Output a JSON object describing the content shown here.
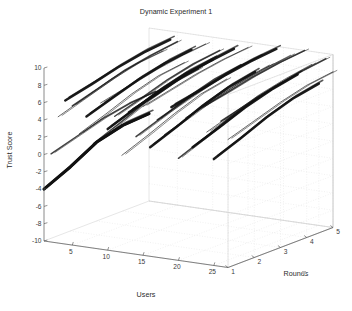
{
  "figure": {
    "title": "Dynamic Experiment 1",
    "background_color": "#ffffff",
    "line_color": "#111111",
    "grid_color": "#e2e2e2",
    "axis_color": "#4a4a4a"
  },
  "chart_data": {
    "type": "line",
    "projection": "3d",
    "title": "Dynamic Experiment 1",
    "xlabel": "Users",
    "ylabel": "Rounds",
    "zlabel": "Trust Score",
    "xlim": [
      1,
      27
    ],
    "ylim": [
      1,
      5
    ],
    "zlim": [
      -10,
      10
    ],
    "xticks": [
      5,
      10,
      15,
      20,
      25
    ],
    "yticks": [
      1,
      2,
      3,
      4,
      5
    ],
    "zticks": [
      -10,
      -8,
      -6,
      -4,
      -2,
      0,
      2,
      4,
      6,
      8,
      10
    ],
    "grid": true,
    "legend": false,
    "x": [
      1,
      2,
      3,
      4,
      5
    ],
    "series": [
      {
        "name": "User 1",
        "user": 1,
        "values": [
          -4.0,
          -2.6,
          -0.9,
          -0.1,
          0.1
        ]
      },
      {
        "name": "User 2",
        "user": 2,
        "values": [
          0.2,
          1.1,
          2.0,
          2.6,
          2.8
        ]
      },
      {
        "name": "User 3",
        "user": 3,
        "values": [
          4.6,
          5.6,
          6.6,
          7.3,
          7.6
        ]
      },
      {
        "name": "User 4",
        "user": 4,
        "values": [
          6.6,
          7.3,
          8.1,
          8.7,
          9.0
        ]
      },
      {
        "name": "User 5",
        "user": 5,
        "values": [
          6.1,
          7.0,
          7.9,
          8.5,
          8.9
        ]
      },
      {
        "name": "User 6",
        "user": 6,
        "values": [
          3.0,
          4.1,
          5.3,
          6.2,
          6.6
        ]
      },
      {
        "name": "User 7",
        "user": 7,
        "values": [
          5.1,
          6.1,
          7.1,
          7.8,
          8.2
        ]
      },
      {
        "name": "User 8",
        "user": 8,
        "values": [
          2.1,
          3.3,
          4.6,
          5.6,
          6.1
        ]
      },
      {
        "name": "User 9",
        "user": 9,
        "values": [
          6.9,
          7.6,
          8.3,
          8.8,
          9.1
        ]
      },
      {
        "name": "User 10",
        "user": 10,
        "values": [
          4.0,
          5.1,
          6.2,
          7.0,
          7.4
        ]
      },
      {
        "name": "User 11",
        "user": 11,
        "values": [
          5.6,
          6.5,
          7.5,
          8.2,
          8.6
        ]
      },
      {
        "name": "User 12",
        "user": 12,
        "values": [
          1.2,
          2.4,
          3.7,
          4.8,
          5.4
        ]
      },
      {
        "name": "User 13",
        "user": 13,
        "values": [
          6.3,
          7.1,
          8.0,
          8.6,
          9.0
        ]
      },
      {
        "name": "User 14",
        "user": 14,
        "values": [
          3.6,
          4.7,
          5.9,
          6.8,
          7.3
        ]
      },
      {
        "name": "User 15",
        "user": 15,
        "values": [
          7.2,
          7.9,
          8.6,
          9.1,
          9.4
        ]
      },
      {
        "name": "User 16",
        "user": 16,
        "values": [
          2.6,
          3.8,
          5.1,
          6.1,
          6.7
        ]
      },
      {
        "name": "User 17",
        "user": 17,
        "values": [
          5.9,
          6.8,
          7.7,
          8.4,
          8.8
        ]
      },
      {
        "name": "User 18",
        "user": 18,
        "values": [
          4.3,
          5.3,
          6.4,
          7.2,
          7.7
        ]
      },
      {
        "name": "User 19",
        "user": 19,
        "values": [
          7.6,
          8.2,
          8.9,
          9.4,
          9.7
        ]
      },
      {
        "name": "User 20",
        "user": 20,
        "values": [
          1.8,
          3.0,
          4.3,
          5.4,
          6.0
        ]
      },
      {
        "name": "User 21",
        "user": 21,
        "values": [
          6.6,
          7.4,
          8.2,
          8.8,
          9.2
        ]
      },
      {
        "name": "User 22",
        "user": 22,
        "values": [
          3.3,
          4.4,
          5.6,
          6.5,
          7.1
        ]
      },
      {
        "name": "User 23",
        "user": 23,
        "values": [
          7.9,
          8.5,
          9.2,
          9.7,
          10.0
        ]
      },
      {
        "name": "User 24",
        "user": 24,
        "values": [
          5.3,
          6.3,
          7.3,
          8.0,
          8.5
        ]
      },
      {
        "name": "User 25",
        "user": 25,
        "values": [
          2.3,
          3.5,
          4.8,
          5.8,
          6.4
        ]
      },
      {
        "name": "User 26",
        "user": 26,
        "values": [
          6.8,
          7.6,
          8.4,
          9.0,
          9.4
        ]
      },
      {
        "name": "User 27",
        "user": 27,
        "values": [
          4.8,
          5.8,
          6.8,
          7.6,
          8.0
        ]
      }
    ]
  },
  "axes": {
    "z_label": "Trust Score",
    "x_label": "Users",
    "y_label": "Rounds",
    "z_ticks": [
      "10",
      "8",
      "6",
      "4",
      "2",
      "0",
      "-2",
      "-4",
      "-6",
      "-8",
      "-10"
    ],
    "x_ticks": [
      "5",
      "10",
      "15",
      "20",
      "25"
    ],
    "y_ticks": [
      "1",
      "2",
      "3",
      "4",
      "5"
    ]
  }
}
